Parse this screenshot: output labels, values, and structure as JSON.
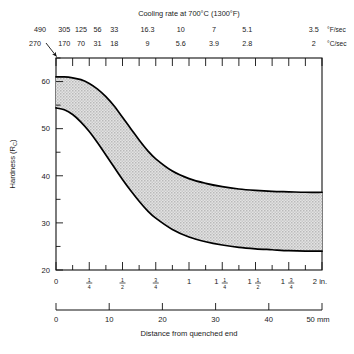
{
  "chart_data": {
    "type": "area",
    "title": "Cooling rate at 700°C (1300°F)",
    "xlabel": "Distance from quenched end",
    "ylabel": "Hardness (RC)",
    "ylabel_main": "Hardness (R",
    "ylabel_sub": "C",
    "ylabel_tail": ")",
    "ylim": [
      20,
      65
    ],
    "yticks_major": [
      20,
      30,
      40,
      50,
      60
    ],
    "yticks_minor": [
      25,
      35,
      45,
      55,
      65
    ],
    "xlim_in": [
      0,
      2
    ],
    "xlim_mm": [
      0,
      50
    ],
    "grid": false,
    "legend": "none",
    "x_in_ticks": [
      "0",
      "1/4",
      "1/2",
      "3/4",
      "1",
      "1 1/4",
      "1 1/2",
      "1 3/4",
      "2 in."
    ],
    "x_in_tick_values": [
      0,
      0.25,
      0.5,
      0.75,
      1.0,
      1.25,
      1.5,
      1.75,
      2.0
    ],
    "x_mm_ticks": [
      "0",
      "10",
      "20",
      "30",
      "40",
      "50 mm"
    ],
    "x_mm_tick_values": [
      0,
      10,
      20,
      30,
      40,
      50
    ],
    "top_axis": {
      "title": "Cooling rate at 700°C (1300°F)",
      "row1_unit": "°F/sec",
      "row2_unit": "°C/sec",
      "corner_f": "490",
      "corner_c": "270",
      "labels_f": [
        "305",
        "125",
        "56",
        "33",
        "16.3",
        "10",
        "7",
        "5.1",
        "3.5"
      ],
      "labels_c": [
        "170",
        "70",
        "31",
        "18",
        "9",
        "5.6",
        "3.9",
        "2.8",
        "2"
      ],
      "label_positions_in": [
        0.0625,
        0.1875,
        0.3125,
        0.4375,
        0.6875,
        0.9375,
        1.1875,
        1.4375,
        1.9375
      ]
    },
    "series": [
      {
        "name": "upper bound (max hardenability)",
        "x_in": [
          0,
          0.0625,
          0.125,
          0.1875,
          0.25,
          0.3125,
          0.375,
          0.4375,
          0.5,
          0.5625,
          0.625,
          0.6875,
          0.75,
          0.875,
          1.0,
          1.125,
          1.25,
          1.375,
          1.5,
          1.625,
          1.75,
          1.875,
          2.0
        ],
        "values": [
          61.0,
          61.0,
          60.8,
          60.4,
          59.6,
          58.4,
          56.8,
          54.8,
          52.4,
          50.0,
          47.6,
          45.4,
          43.6,
          41.0,
          39.4,
          38.4,
          37.7,
          37.2,
          36.9,
          36.7,
          36.6,
          36.5,
          36.5
        ]
      },
      {
        "name": "lower bound (min hardenability)",
        "x_in": [
          0,
          0.0625,
          0.125,
          0.1875,
          0.25,
          0.3125,
          0.375,
          0.4375,
          0.5,
          0.5625,
          0.625,
          0.6875,
          0.75,
          0.875,
          1.0,
          1.125,
          1.25,
          1.375,
          1.5,
          1.625,
          1.75,
          1.875,
          2.0
        ],
        "values": [
          54.4,
          54.0,
          53.0,
          51.4,
          49.4,
          47.0,
          44.4,
          41.8,
          39.2,
          36.8,
          34.6,
          32.6,
          31.0,
          28.6,
          27.0,
          26.0,
          25.3,
          24.8,
          24.5,
          24.3,
          24.1,
          24.0,
          24.0
        ]
      }
    ],
    "band_fill_color": "#d8d8d8",
    "band_note": "Shaded hardenability band between upper and lower bounds"
  }
}
